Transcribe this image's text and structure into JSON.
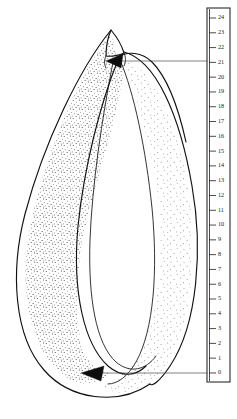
{
  "figure": {
    "title": "Stippled teardrop structure with vertical measurement scale",
    "background_color": "#ffffff",
    "ink_color": "#111111",
    "stipple_color": "#3a3a3a",
    "leader_color": "#4a4a4a"
  },
  "scale": {
    "name": "vertical-measurement-ruler",
    "orientation": "vertical",
    "min": 0,
    "max": 24,
    "step": 1,
    "top_value": 24,
    "bottom_value": 0,
    "labels": [
      "24",
      "23",
      "22",
      "21",
      "20",
      "19",
      "18",
      "17",
      "16",
      "15",
      "14",
      "13",
      "12",
      "11",
      "10",
      "9",
      "8",
      "7",
      "6",
      "5",
      "4",
      "3",
      "2",
      "1",
      "0"
    ],
    "box": {
      "x": 207,
      "y": 8,
      "width": 23,
      "height": 374
    },
    "tick_x_start": 209,
    "tick_x_end": 216,
    "label_x": 218,
    "tick_top_y": 18,
    "tick_spacing": 14.79
  },
  "annotations": [
    {
      "name": "upper-leader",
      "value": "21",
      "tip_x": 108,
      "tip_y": 61,
      "line_y": 61,
      "line_x_end": 209,
      "arrow_direction": "left"
    },
    {
      "name": "lower-leader",
      "value": "0",
      "tip_x": 82,
      "tip_y": 373,
      "line_y": 373,
      "line_x_end": 209,
      "arrow_direction": "left"
    }
  ],
  "chart_data": {
    "type": "line",
    "title": "Stippled teardrop structure with vertical measurement scale",
    "xlabel": "",
    "ylabel": "",
    "ylim": [
      0,
      24
    ],
    "grid": false,
    "legend": "none",
    "axis_ticks": [
      0,
      1,
      2,
      3,
      4,
      5,
      6,
      7,
      8,
      9,
      10,
      11,
      12,
      13,
      14,
      15,
      16,
      17,
      18,
      19,
      20,
      21,
      22,
      23,
      24
    ],
    "annotated_values": [
      21,
      0
    ],
    "series": [
      {
        "name": "upper-measurement",
        "values": [
          21
        ]
      },
      {
        "name": "lower-measurement",
        "values": [
          0
        ]
      }
    ]
  }
}
